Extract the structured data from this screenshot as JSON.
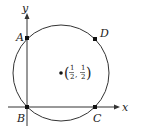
{
  "diagram": {
    "type": "coordinate-geometry",
    "axes": {
      "x_label": "x",
      "y_label": "y"
    },
    "circle": {
      "center_label": {
        "x_num": "1",
        "x_den": "2",
        "y_num": "1",
        "y_den": "2",
        "open": "(",
        "comma": ",",
        "close": ")"
      }
    },
    "points": [
      {
        "label": "A",
        "desc": "circle meets positive y-axis"
      },
      {
        "label": "B",
        "desc": "origin"
      },
      {
        "label": "C",
        "desc": "circle meets positive x-axis"
      },
      {
        "label": "D",
        "desc": "upper right point on circle"
      }
    ],
    "colors": {
      "stroke": "#333333",
      "point": "#111111",
      "background": "#ffffff"
    }
  }
}
